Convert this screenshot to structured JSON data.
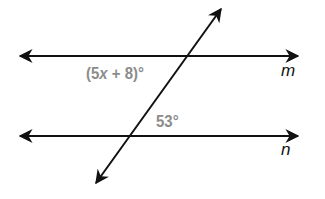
{
  "diagram": {
    "type": "parallel-lines-transversal",
    "lines": {
      "m": {
        "label": "m",
        "y": 56
      },
      "n": {
        "label": "n",
        "y": 136
      },
      "transversal": {
        "from": [
          96,
          183
        ],
        "to": [
          220,
          10
        ]
      }
    },
    "angles": [
      {
        "id": "top",
        "pre": "(5",
        "var": "x",
        "post": " + 8)°",
        "position": "below line m, left of transversal"
      },
      {
        "id": "bottom",
        "text": "53°",
        "position": "above line n, right of transversal"
      }
    ],
    "colors": {
      "lines": "#111111",
      "angle_labels": "#8c8c8c",
      "background": "#ffffff"
    }
  }
}
